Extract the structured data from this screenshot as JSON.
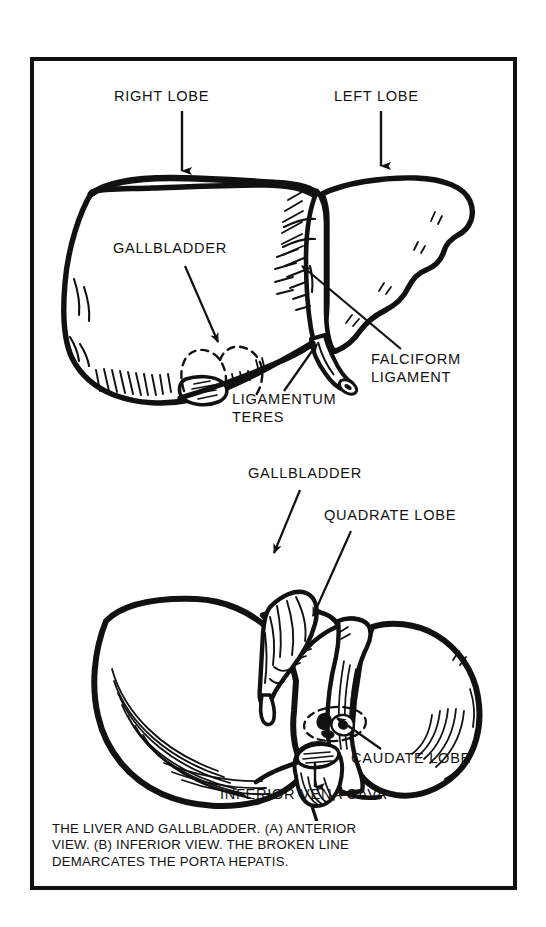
{
  "plate": {
    "caption": "THE LIVER AND GALLBLADDER.  (A) ANTERIOR\nVIEW.  (B) INFERIOR VIEW.  THE BROKEN LINE\nDEMARCATES THE PORTA HEPATIS.",
    "border_color": "#111111",
    "background_color": "#ffffff",
    "ink_color": "#111111"
  },
  "figure_a": {
    "name": "anterior-view-of-liver",
    "labels": {
      "right_lobe": "RIGHT LOBE",
      "left_lobe": "LEFT LOBE",
      "gallbladder": "GALLBLADDER",
      "falciform_ligament_line1": "FALCIFORM",
      "falciform_ligament_line2": "LIGAMENT",
      "ligamentum_teres_line1": "LIGAMENTUM",
      "ligamentum_teres_line2": "TERES"
    }
  },
  "figure_b": {
    "name": "inferior-view-of-liver",
    "labels": {
      "gallbladder": "GALLBLADDER",
      "quadrate_lobe": "QUADRATE LOBE",
      "caudate_lobe": "CAUDATE LOBE",
      "inferior_vena_cava": "INFERIOR VENA CAVA"
    }
  }
}
